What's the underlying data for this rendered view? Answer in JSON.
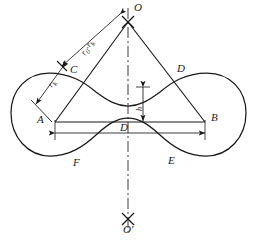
{
  "figure": {
    "type": "engineering-geometry-diagram",
    "stroke_color": "#1a1a1a",
    "background_color": "#ffffff"
  },
  "points": {
    "o_top": "O",
    "o_bottom": "O'",
    "a": "A",
    "b": "B",
    "c": "C",
    "d": "D",
    "e": "E",
    "f": "F"
  },
  "dimensions": {
    "diagonal_long": "r₀-rₖ",
    "diagonal_long_base": "r",
    "diagonal_long_sub1": "0",
    "diagonal_long_dash": "-",
    "diagonal_long_base2": "r",
    "diagonal_long_sub2": "k",
    "diagonal_short": "rₖ",
    "diagonal_short_base": "r",
    "diagonal_short_sub": "k",
    "height": "h",
    "width": "D"
  },
  "geometry": {
    "o_apex": [
      128,
      22
    ],
    "a_vertex": [
      55,
      122
    ],
    "b_vertex": [
      205,
      122
    ],
    "c_point": [
      70,
      73
    ],
    "d_point": [
      177,
      73
    ],
    "centerline_top": [
      128,
      8
    ],
    "centerline_bottom": [
      128,
      232
    ],
    "left_lobe_center": [
      50,
      113
    ],
    "right_lobe_center": [
      208,
      113
    ],
    "lobe_radius": 40
  }
}
